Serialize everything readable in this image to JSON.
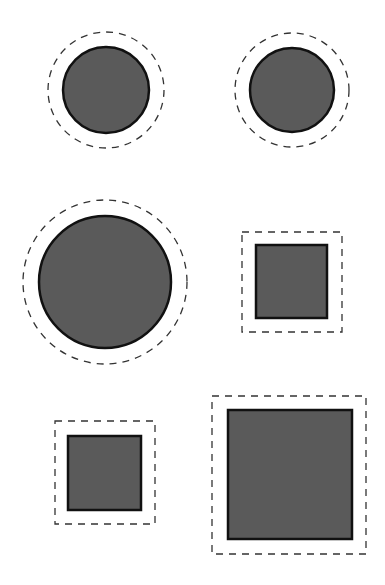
{
  "canvas": {
    "width": 385,
    "height": 585,
    "background": "#ffffff"
  },
  "style": {
    "fill": "#5a5a5a",
    "stroke": "#111111",
    "stroke_width": 2.5,
    "dash_stroke": "#333333",
    "dash_width": 1.3,
    "dash_pattern": "7 6"
  },
  "shapes": [
    {
      "id": "circle-top-left",
      "type": "circle",
      "cx": 106,
      "cy": 90,
      "r": 43,
      "outline_r": 58
    },
    {
      "id": "circle-top-right",
      "type": "circle",
      "cx": 292,
      "cy": 90,
      "r": 42,
      "outline_r": 57
    },
    {
      "id": "circle-large",
      "type": "circle",
      "cx": 105,
      "cy": 282,
      "r": 66,
      "outline_r": 82
    },
    {
      "id": "square-middle-right",
      "type": "square",
      "x": 256,
      "y": 245,
      "w": 71,
      "h": 73,
      "outline_x": 242,
      "outline_y": 232,
      "outline_w": 100,
      "outline_h": 100
    },
    {
      "id": "square-small-bottom-left",
      "type": "square",
      "x": 68,
      "y": 436,
      "w": 73,
      "h": 74,
      "outline_x": 55,
      "outline_y": 421,
      "outline_w": 100,
      "outline_h": 103
    },
    {
      "id": "square-large-bottom-right",
      "type": "square",
      "x": 228,
      "y": 410,
      "w": 124,
      "h": 129,
      "outline_x": 212,
      "outline_y": 396,
      "outline_w": 154,
      "outline_h": 158
    }
  ]
}
